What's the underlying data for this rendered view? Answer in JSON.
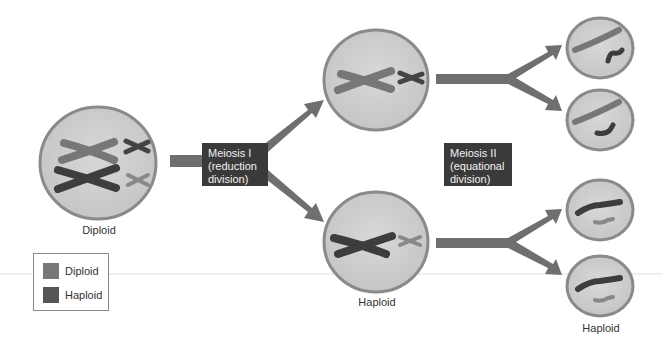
{
  "diagram": {
    "title": "Meiosis",
    "colors": {
      "background": "#ffffff",
      "cell_fill": "#d2d2d2",
      "cell_border": "#8a8a8a",
      "arrow": "#6f6f6f",
      "diploid_chromosome": "#777777",
      "haploid_chromosome": "#3d3d3d",
      "stage_box": "#3a3a3a",
      "stage_box_text": "#f2f2f2"
    },
    "cells": {
      "parent": {
        "label": "Diploid"
      },
      "meiosis1_top": {
        "label": ""
      },
      "meiosis1_bottom": {
        "label": "Haploid"
      },
      "meiosis2_bottom_group": {
        "label": "Haploid"
      }
    },
    "stages": {
      "meiosis1": {
        "line1": "Meiosis I",
        "line2": "(reduction",
        "line3": "division)"
      },
      "meiosis2": {
        "line1": "Meiosis II",
        "line2": "(equational",
        "line3": "division)"
      }
    },
    "legend": {
      "items": [
        {
          "label": "Diploid",
          "color": "#777777"
        },
        {
          "label": "Haploid",
          "color": "#555555"
        }
      ]
    }
  }
}
